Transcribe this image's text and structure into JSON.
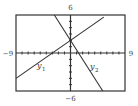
{
  "chart_data": {
    "type": "line",
    "title": "",
    "xlabel": "",
    "ylabel": "",
    "xlim": [
      -9,
      9
    ],
    "ylim": [
      -6,
      6
    ],
    "xscale_ticks": 1,
    "yscale_ticks": 1,
    "grid": false,
    "window_labels": {
      "xmin": "−9",
      "xmax": "9",
      "ymin": "−6",
      "ymax": "6"
    },
    "series": [
      {
        "name": "y1",
        "label_main": "y",
        "label_sub": "1",
        "equation": "y = (2/3)x + 2",
        "slope": 0.6667,
        "intercept": 2,
        "x": [
          -9,
          5.5
        ],
        "y": [
          -4,
          5.67
        ]
      },
      {
        "name": "y2",
        "label_main": "y",
        "label_sub": "2",
        "equation": "y = -1.5x + 2",
        "slope": -1.5,
        "intercept": 2,
        "x": [
          -2.67,
          5.33
        ],
        "y": [
          6,
          -6
        ]
      }
    ],
    "colors": {
      "line": "#333333",
      "frame": "#333333",
      "background": "#ffffff"
    }
  }
}
